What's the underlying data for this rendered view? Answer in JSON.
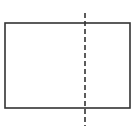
{
  "diagram": {
    "colors": {
      "background": "#ffffff",
      "stroke": "#333333"
    },
    "rectangle": {
      "x": 5,
      "y": 23,
      "width": 125,
      "height": 85,
      "stroke_width": 1.6
    },
    "dashed_line": {
      "x": 85,
      "y1": 13,
      "y2": 126,
      "stroke_width": 1.6,
      "dash": "5,3"
    }
  }
}
